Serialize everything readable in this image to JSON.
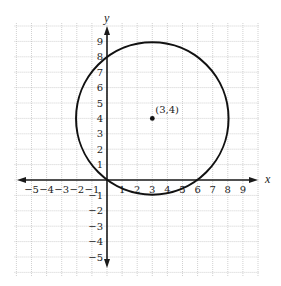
{
  "chart_data": {
    "type": "scatter",
    "title": "",
    "xlabel": "x",
    "ylabel": "y",
    "xlim": [
      -6,
      10
    ],
    "ylim": [
      -6,
      10
    ],
    "grid": true,
    "x_ticks": [
      "-5",
      "-4",
      "-3",
      "-2",
      "-1",
      "1",
      "2",
      "3",
      "4",
      "5",
      "6",
      "7",
      "8",
      "9"
    ],
    "y_ticks": [
      "9",
      "8",
      "7",
      "6",
      "5",
      "4",
      "3",
      "2",
      "1",
      "-1",
      "-2",
      "-3",
      "-4",
      "-5"
    ],
    "circle": {
      "center": [
        3,
        4
      ],
      "radius": 5
    },
    "points": [
      {
        "x": 3,
        "y": 4,
        "label": "(3,4)"
      }
    ],
    "annotations": [
      "(3,4)"
    ]
  },
  "colors": {
    "grid": "#bdbdbd",
    "axis": "#1a1a1a",
    "curve": "#111111"
  }
}
